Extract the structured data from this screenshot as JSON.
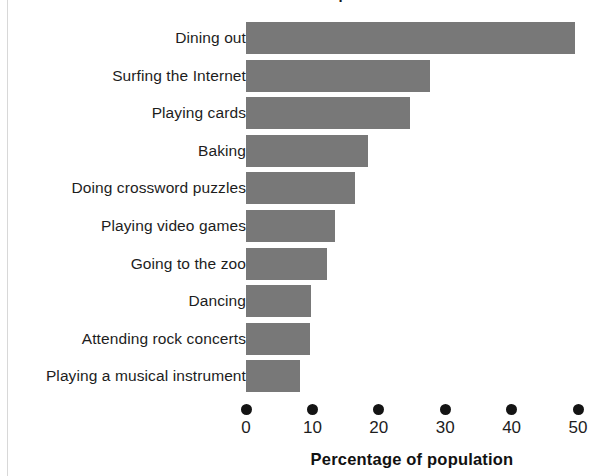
{
  "page": {
    "background_color": "#ffffff",
    "title_fragment": "Favourite leisure pursuits"
  },
  "chart_data": {
    "type": "bar",
    "orientation": "horizontal",
    "title": "",
    "xlabel": "Percentage of population",
    "ylabel": "",
    "xlim": [
      0,
      50
    ],
    "xticks": [
      0,
      10,
      20,
      30,
      40,
      50
    ],
    "xtick_labels": [
      "0",
      "10",
      "20",
      "30",
      "40",
      "50"
    ],
    "grid": false,
    "legend": false,
    "bar_color": "#787878",
    "tick_marker": "filled-circle",
    "categories": [
      "Dining out",
      "Surfing the Internet",
      "Playing cards",
      "Baking",
      "Doing crossword puzzles",
      "Playing video games",
      "Going to the zoo",
      "Dancing",
      "Attending rock concerts",
      "Playing a musical instrument"
    ],
    "values": [
      49.5,
      27.7,
      24.7,
      18.4,
      16.4,
      13.4,
      12.2,
      9.8,
      9.6,
      8.1
    ]
  }
}
